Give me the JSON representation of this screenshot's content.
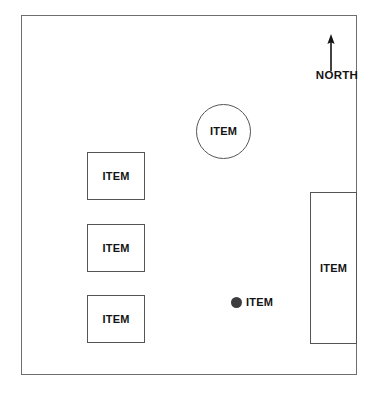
{
  "diagram": {
    "background_color": "#ffffff",
    "boundary": {
      "name": "site boundary",
      "stroke_color": "#6e6e70"
    },
    "compass": {
      "label": "NORTH",
      "arrow_direction": "up",
      "icon": "north-arrow-icon"
    },
    "shapes": [
      {
        "id": "circle-item",
        "shape": "circle",
        "label": "ITEM",
        "stroke_color": "#555557",
        "fill_color": "#ffffff"
      },
      {
        "id": "rect-item-top-left",
        "shape": "rectangle",
        "label": "ITEM",
        "stroke_color": "#555557",
        "fill_color": "#ffffff"
      },
      {
        "id": "rect-item-middle-left",
        "shape": "rectangle",
        "label": "ITEM",
        "stroke_color": "#555557",
        "fill_color": "#ffffff"
      },
      {
        "id": "rect-item-bottom-left",
        "shape": "rectangle",
        "label": "ITEM",
        "stroke_color": "#555557",
        "fill_color": "#ffffff"
      },
      {
        "id": "rect-item-tall-right",
        "shape": "rectangle",
        "label": "ITEM",
        "stroke_color": "#555557",
        "fill_color": "#ffffff"
      },
      {
        "id": "point-item-center",
        "shape": "filled-dot",
        "label": "ITEM",
        "fill_color": "#3d3d3f"
      }
    ]
  }
}
